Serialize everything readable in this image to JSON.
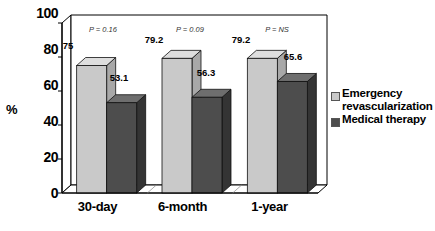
{
  "chart_data": {
    "type": "bar",
    "title": "",
    "subtitle": "",
    "xlabel": "",
    "ylabel": "%",
    "ylim": [
      0,
      100
    ],
    "yticks": [
      "0",
      "20",
      "40",
      "60",
      "80",
      "100"
    ],
    "grid": false,
    "legend_position": "right",
    "categories": [
      "30-day",
      "6-month",
      "1-year"
    ],
    "series": [
      {
        "name": "Emergency\nrevascularization",
        "color": "#c9c9c9",
        "values": [
          75,
          79.2,
          79.2
        ],
        "value_labels": [
          "75",
          "79.2",
          "79.2"
        ]
      },
      {
        "name": "Medical therapy",
        "color": "#4d4d4d",
        "values": [
          53.1,
          56.3,
          65.6
        ],
        "value_labels": [
          "53.1",
          "56.3",
          "65.6"
        ]
      }
    ],
    "annotations": [
      "P = 0.16",
      "P = 0.09",
      "P = NS"
    ]
  },
  "colors": {
    "series_light": "#c9c9c9",
    "series_light_top": "#dedede",
    "series_light_side": "#a8a8a8",
    "series_dark": "#4d4d4d",
    "series_dark_top": "#6e6e6e",
    "series_dark_side": "#343434",
    "frame": "#000000",
    "background": "#ffffff"
  }
}
